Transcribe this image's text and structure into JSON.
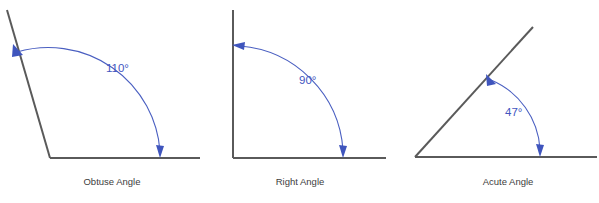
{
  "figure": {
    "background_color": "#ffffff",
    "ray_color": "#5a5a5a",
    "arc_color": "#4a5fc1",
    "value_color": "#4256bf",
    "caption_color": "#3d3d3d"
  },
  "diagrams": [
    {
      "id": "obtuse",
      "caption": "Obtuse Angle",
      "angle_value": "110°",
      "degrees": 110,
      "vertex": {
        "x": 50,
        "y": 158
      },
      "ray_horizontal_end": {
        "x": 200,
        "y": 158
      },
      "ray_slanted_end": {
        "x": 7,
        "y": 10
      },
      "value_label_position": {
        "x": 106,
        "y": 72
      },
      "caption_position": {
        "x": 112,
        "y": 185
      },
      "arc_start": {
        "x": 15,
        "y": 50
      },
      "arc_end": {
        "x": 160,
        "y": 155
      }
    },
    {
      "id": "right",
      "caption": "Right Angle",
      "angle_value": "90°",
      "degrees": 90,
      "vertex": {
        "x": 233,
        "y": 158
      },
      "ray_horizontal_end": {
        "x": 386,
        "y": 158
      },
      "ray_slanted_end": {
        "x": 233,
        "y": 10
      },
      "value_label_position": {
        "x": 299,
        "y": 84
      },
      "caption_position": {
        "x": 300,
        "y": 185
      },
      "arc_start": {
        "x": 236,
        "y": 45
      },
      "arc_end": {
        "x": 343,
        "y": 155
      }
    },
    {
      "id": "acute",
      "caption": "Acute Angle",
      "angle_value": "47°",
      "degrees": 47,
      "vertex": {
        "x": 415,
        "y": 157
      },
      "ray_horizontal_end": {
        "x": 597,
        "y": 157
      },
      "ray_slanted_end": {
        "x": 533,
        "y": 27
      },
      "value_label_position": {
        "x": 505,
        "y": 116
      },
      "caption_position": {
        "x": 508,
        "y": 185
      },
      "arc_start": {
        "x": 489,
        "y": 77
      },
      "arc_end": {
        "x": 540,
        "y": 154
      }
    }
  ]
}
